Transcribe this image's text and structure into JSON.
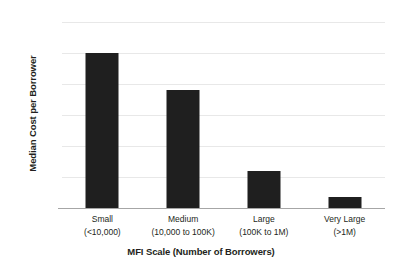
{
  "chart_data": {
    "type": "bar",
    "title": "",
    "xlabel": "MFI Scale (Number of Borrowers)",
    "ylabel": "Median Cost per Borrower",
    "categories": [
      "Small\n(<10,000)",
      "Medium\n(10,000 to 100K)",
      "Large\n(100K to 1M)",
      "Very Large\n(>1M)"
    ],
    "category_lines": [
      {
        "line1": "Small",
        "line2": "(<10,000)"
      },
      {
        "line1": "Medium",
        "line2": "(10,000 to 100K)"
      },
      {
        "line1": "Large",
        "line2": "(100K to 1M)"
      },
      {
        "line1": "Very Large",
        "line2": "(>1M)"
      }
    ],
    "values": [
      250,
      190,
      60,
      18
    ],
    "ylim": [
      0,
      300
    ],
    "ytick_values": [
      0,
      50,
      100,
      150,
      200,
      250,
      300
    ],
    "ytick_labels": [
      "$0",
      "$50",
      "$100",
      "$150",
      "$200",
      "$250",
      "$300"
    ],
    "grid": true,
    "grid_axis": "y",
    "legend": false,
    "legend_position": "none",
    "bar_color": "#1f1f1f",
    "gridline_color": "#E8E8E8",
    "axis_color": "#A6A6A6",
    "text_color": "#231F20",
    "background_color": "#FFFFFF"
  }
}
